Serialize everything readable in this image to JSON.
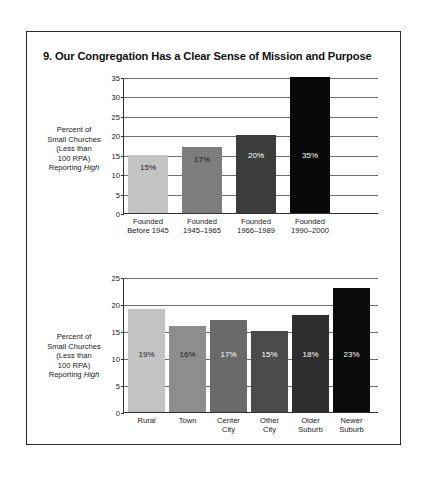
{
  "figure": {
    "title": "9. Our Congregation Has a Clear Sense of Mission and Purpose"
  },
  "axis_label": {
    "line1": "Percent of",
    "line2": "Small Churches",
    "line3": "(Less than",
    "line4": "100 RPA)",
    "line5_prefix": "Reporting ",
    "line5_em": "High"
  },
  "chart_data": [
    {
      "type": "bar",
      "title": "9. Our Congregation Has a Clear Sense of Mission and Purpose",
      "xlabel": "",
      "ylabel": "Percent of Small Churches (Less than 100 RPA) Reporting High",
      "ylim": [
        0,
        35
      ],
      "yticks": [
        0,
        5,
        10,
        15,
        20,
        25,
        30,
        35
      ],
      "grid": true,
      "legend": "none",
      "categories": [
        "Founded Before 1945",
        "Founded 1945–1965",
        "Founded 1966–1989",
        "Founded 1990–2000"
      ],
      "category_lines": [
        [
          "Founded",
          "Before 1945"
        ],
        [
          "Founded",
          "1945–1965"
        ],
        [
          "Founded",
          "1966–1989"
        ],
        [
          "Founded",
          "1990–2000"
        ]
      ],
      "values": [
        15,
        17,
        20,
        35
      ],
      "data_labels": [
        "15%",
        "17%",
        "20%",
        "35%"
      ],
      "bar_colors": [
        "#c3c3c3",
        "#7d7d7d",
        "#3d3d3d",
        "#080808"
      ],
      "label_colors": [
        "#1a1a1a",
        "#1a1a1a",
        "#ffffff",
        "#ffffff"
      ]
    },
    {
      "type": "bar",
      "title": "",
      "xlabel": "",
      "ylabel": "Percent of Small Churches (Less than 100 RPA) Reporting High",
      "ylim": [
        0,
        25
      ],
      "yticks": [
        0,
        5,
        10,
        15,
        20,
        25
      ],
      "grid": true,
      "legend": "none",
      "categories": [
        "Rural",
        "Town",
        "Center City",
        "Other City",
        "Older Suburb",
        "Newer Suburb"
      ],
      "category_lines": [
        [
          "Rural"
        ],
        [
          "Town"
        ],
        [
          "Center",
          "City"
        ],
        [
          "Other",
          "City"
        ],
        [
          "Older",
          "Suburb"
        ],
        [
          "Newer",
          "Suburb"
        ]
      ],
      "values": [
        19,
        16,
        17,
        15,
        18,
        23
      ],
      "data_labels": [
        "19%",
        "16%",
        "17%",
        "15%",
        "18%",
        "23%"
      ],
      "bar_colors": [
        "#c3c3c3",
        "#8d8d8d",
        "#6a6a6a",
        "#4b4b4b",
        "#2e2e2e",
        "#0a0a0a"
      ],
      "label_colors": [
        "#1a1a1a",
        "#1a1a1a",
        "#ffffff",
        "#ffffff",
        "#ffffff",
        "#ffffff"
      ]
    }
  ]
}
